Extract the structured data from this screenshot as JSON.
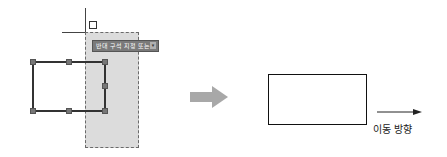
{
  "before": {
    "tooltip": {
      "text": "반대 구석 지정 또는",
      "dropdown_icon": "down-arrow-icon",
      "dropdown_glyph": "▾"
    },
    "pickbox_icon": "pickbox-icon",
    "grip_color": "#777777",
    "selection_window_color": "#dcdcdc"
  },
  "transition_arrow": {
    "icon": "right-arrow-icon",
    "color": "#a8a8a8"
  },
  "after": {
    "direction_label": "이동 방향",
    "direction_icon": "right-arrow-icon"
  }
}
